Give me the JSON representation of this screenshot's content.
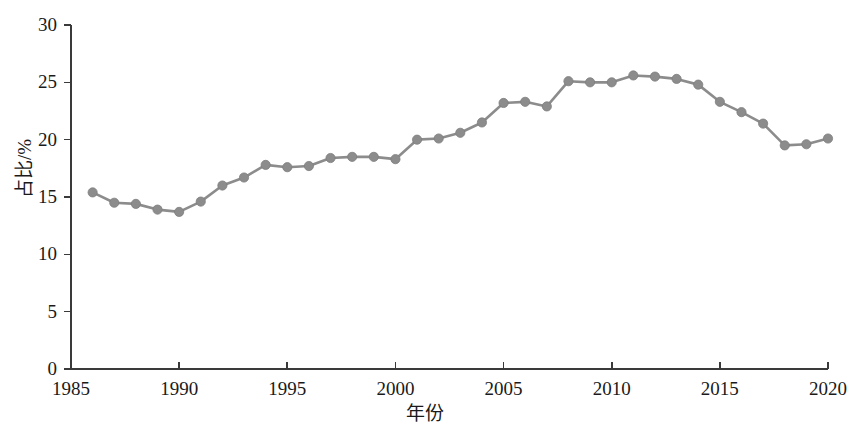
{
  "chart_data": {
    "type": "line",
    "title": "",
    "subtitle": "",
    "xlabel": "年份",
    "ylabel": "占比/%",
    "xlim": [
      1985,
      2020
    ],
    "ylim": [
      0,
      30
    ],
    "xticks": [
      1985,
      1990,
      1995,
      2000,
      2005,
      2010,
      2015,
      2020
    ],
    "yticks": [
      0,
      5,
      10,
      15,
      20,
      25,
      30
    ],
    "xtick_labels": [
      "1985",
      "1990",
      "1995",
      "2000",
      "2005",
      "2010",
      "2015",
      "2020"
    ],
    "ytick_labels": [
      "0",
      "5",
      "10",
      "15",
      "20",
      "25",
      "30"
    ],
    "grid": false,
    "legend": null,
    "legend_position": "none",
    "marker": "circle",
    "marker_color": "#8c8c8c",
    "line_color": "#8c8c8c",
    "axis_color": "#3a3a3a",
    "x": [
      1986,
      1987,
      1988,
      1989,
      1990,
      1991,
      1992,
      1993,
      1994,
      1995,
      1996,
      1997,
      1998,
      1999,
      2000,
      2001,
      2002,
      2003,
      2004,
      2005,
      2006,
      2007,
      2008,
      2009,
      2010,
      2011,
      2012,
      2013,
      2014,
      2015,
      2016,
      2017,
      2018,
      2019,
      2020
    ],
    "values": [
      15.4,
      14.5,
      14.4,
      13.9,
      13.7,
      14.6,
      16.0,
      16.7,
      17.8,
      17.6,
      17.7,
      18.4,
      18.5,
      18.5,
      18.3,
      20.0,
      20.1,
      20.6,
      21.5,
      23.2,
      23.3,
      22.9,
      25.1,
      25.0,
      25.0,
      25.6,
      25.5,
      25.3,
      24.8,
      23.3,
      22.4,
      21.4,
      19.5,
      19.6,
      20.1
    ],
    "series": [
      {
        "name": "占比",
        "values": [
          15.4,
          14.5,
          14.4,
          13.9,
          13.7,
          14.6,
          16.0,
          16.7,
          17.8,
          17.6,
          17.7,
          18.4,
          18.5,
          18.5,
          18.3,
          20.0,
          20.1,
          20.6,
          21.5,
          23.2,
          23.3,
          22.9,
          25.1,
          25.0,
          25.0,
          25.6,
          25.5,
          25.3,
          24.8,
          23.3,
          22.4,
          21.4,
          19.5,
          19.6,
          20.1
        ]
      }
    ]
  }
}
